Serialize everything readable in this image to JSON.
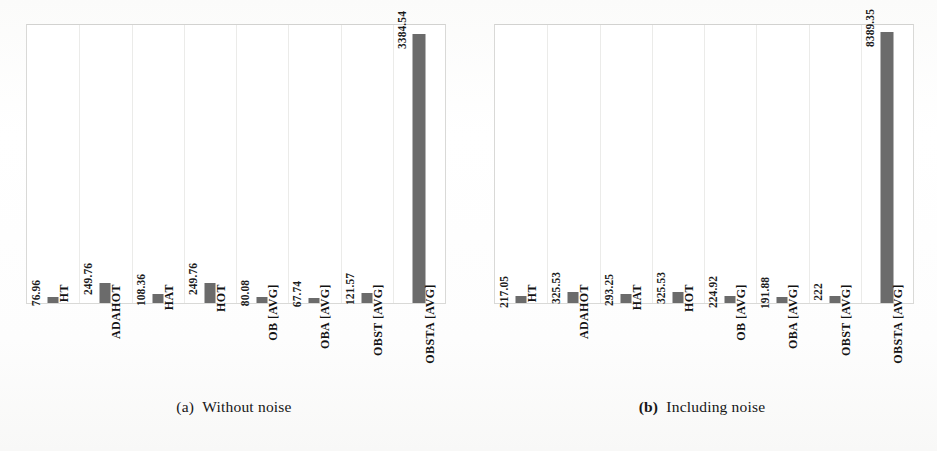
{
  "figure": {
    "background_color": "#fdfdfc",
    "bar_color": "#6b6b6b",
    "gridline_color": "#ebebe9",
    "axis_border_color": "#d9d9d7"
  },
  "panels": [
    {
      "id": "a",
      "caption_prefix": "(a)",
      "caption_text": "Without noise",
      "caption_prefix_bold": false
    },
    {
      "id": "b",
      "caption_prefix": "(b)",
      "caption_text": "Including noise",
      "caption_prefix_bold": true
    }
  ],
  "chart_data": [
    {
      "type": "bar",
      "title": "(a) Without noise",
      "xlabel": "",
      "ylabel": "",
      "grid": true,
      "legend": "none",
      "orientation": "vertical",
      "ylim": [
        0,
        3500
      ],
      "categories": [
        "HT",
        "ADAHOT",
        "HAT",
        "HOT",
        "OB [AVG]",
        "OBA [AVG]",
        "OBST [AVG]",
        "OBSTA [AVG]"
      ],
      "values": [
        76.96,
        249.76,
        108.36,
        249.76,
        80.08,
        67.74,
        121.57,
        3384.54
      ],
      "value_labels": [
        "76.96",
        "249.76",
        "108.36",
        "249.76",
        "80.08",
        "67.74",
        "121.57",
        "3384.54"
      ]
    },
    {
      "type": "bar",
      "title": "(b) Including noise",
      "xlabel": "",
      "ylabel": "",
      "grid": true,
      "legend": "none",
      "orientation": "vertical",
      "ylim": [
        0,
        8600
      ],
      "categories": [
        "HT",
        "ADAHOT",
        "HAT",
        "HOT",
        "OB [AVG]",
        "OBA [AVG]",
        "OBST [AVG]",
        "OBSTA [AVG]"
      ],
      "values": [
        217.05,
        325.53,
        293.25,
        325.53,
        224.92,
        191.88,
        222,
        8389.35
      ],
      "value_labels": [
        "217.05",
        "325.53",
        "293.25",
        "325.53",
        "224.92",
        "191.88",
        "222",
        "8389.35"
      ]
    }
  ]
}
